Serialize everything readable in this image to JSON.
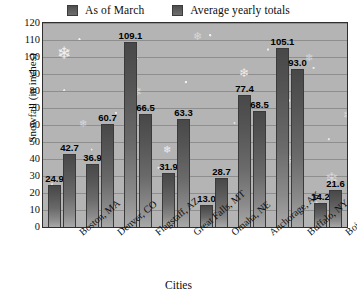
{
  "chart_data": {
    "type": "bar",
    "title": "",
    "xlabel": "Cities",
    "ylabel": "Snowfall (in inches)",
    "ylim": [
      0,
      120
    ],
    "ytick_step": 10,
    "yticks": [
      120,
      110,
      100,
      90,
      80,
      70,
      60,
      50,
      40,
      30,
      20,
      10,
      0
    ],
    "grid": true,
    "legend_position": "top-center",
    "categories": [
      "Boston, MA",
      "Denver, CO",
      "Flagstaff, AZ",
      "Great Falls, MT",
      "Omaha, NE",
      "Anchorage, AK",
      "Buffalo, NY",
      "Boise, ID"
    ],
    "series": [
      {
        "name": "As of March",
        "values": [
          24.9,
          36.9,
          109.1,
          31.9,
          13.0,
          77.4,
          105.1,
          14.2
        ]
      },
      {
        "name": "Average yearly totals",
        "values": [
          42.7,
          60.7,
          66.5,
          63.3,
          28.7,
          68.5,
          93.0,
          21.6
        ]
      }
    ]
  },
  "legend": {
    "items": [
      {
        "label": "As of March",
        "color": "#565656"
      },
      {
        "label": "Average yearly totals",
        "color": "#565656"
      }
    ]
  },
  "axes": {
    "y_title": "Snowfall (in inches)",
    "x_title": "Cities"
  },
  "style": {
    "plot_background": "#b4b4b4",
    "gridline_color": "#8e8e8e",
    "bar_color": "#565656",
    "axis_color": "#2e2e2e",
    "value_label_color": "#000000"
  },
  "decorations": {
    "snowflake_glyph": "❄"
  }
}
